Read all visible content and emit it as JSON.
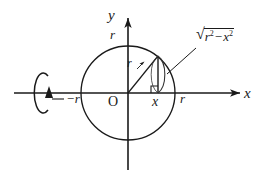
{
  "figure": {
    "kind": "math-diagram",
    "colors": {
      "stroke": "#1a1a1a",
      "background": "#ffffff",
      "thin_stroke": "#333333"
    },
    "axes": {
      "y_axis_label": "y",
      "x_axis_label": "x",
      "origin_label": "O"
    },
    "ticks": {
      "y_top": "r",
      "x_right": "r",
      "x_left": "−r",
      "foot_point": "x"
    },
    "annotations": {
      "radius_label": "r",
      "height_sqrt_sign": "√",
      "height_base_1": "r",
      "height_exponent_1": "2",
      "height_operator": "−",
      "height_base_2": "x",
      "height_exponent_2": "2",
      "height_label_plain": "√(r² − x²)"
    },
    "geometry": {
      "circle_center_px": [
        128,
        93
      ],
      "circle_radius_px": 47,
      "point_on_circle_px": [
        158,
        56
      ],
      "foot_on_axis_px": [
        158,
        93
      ],
      "rotation_marker_center_px": [
        41,
        93
      ],
      "rotation_marker_rx_px": 9,
      "rotation_marker_ry_px": 20
    }
  }
}
